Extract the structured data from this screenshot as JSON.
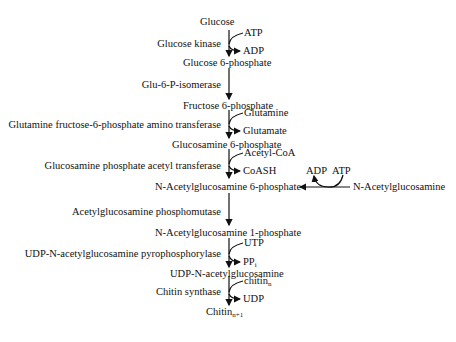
{
  "diagram": {
    "compounds": {
      "glucose": "Glucose",
      "g6p": "Glucose 6-phosphate",
      "f6p": "Fructose 6-phosphate",
      "gln6p": "Glucosamine 6-phosphate",
      "nag6p": "N-Acetylglucosamine 6-phosphate",
      "nag": "N-Acetylglucosamine",
      "nag1p": "N-Acetylglucosamine 1-phosphate",
      "udpnag": "UDP-N-acetylglucosamine",
      "chitin_base": "Chitin",
      "chitin_sub": "n+1"
    },
    "enzymes": {
      "e1": "Glucose kinase",
      "e2": "Glu-6-P-isomerase",
      "e3": "Glutamine fructose-6-phosphate amino transferase",
      "e4": "Glucosamine phosphate acetyl transferase",
      "e5": "Acetylglucosamine phosphomutase",
      "e6": "UDP-N-acetylglucosamine pyrophosphorylase",
      "e7": "Chitin synthase"
    },
    "cofactors": {
      "atp1": "ATP",
      "adp1": "ADP",
      "glutamine": "Glutamine",
      "glutamate": "Glutamate",
      "acetylcoa": "Acetyl-CoA",
      "coash": "CoASH",
      "adp2": "ADP",
      "atp2": "ATP",
      "utp": "UTP",
      "ppi_base": "PP",
      "ppi_sub": "i",
      "chitin_n_base": "chitin",
      "chitin_n_sub": "n",
      "udp": "UDP"
    }
  }
}
